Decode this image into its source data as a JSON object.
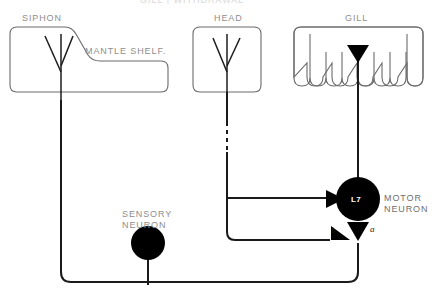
{
  "figure": {
    "top_cut_title": "GILL  |  WITHDRAWAL",
    "labels": {
      "siphon": "SIPHON",
      "mantle_shelf": "MANTLE SHELF.",
      "head": "HEAD",
      "gill": "GILL",
      "sensory_neuron": "SENSORY\nNEURON",
      "sensory_neuron_line1": "SENSORY",
      "sensory_neuron_line2": "NEURON",
      "motor_neuron_line1": "MOTOR",
      "motor_neuron_line2": "NEURON",
      "l7": "L7",
      "synapse_b": "b",
      "synapse_a": "a"
    },
    "colors": {
      "outline": "#3a3a3a",
      "organ_outline": "#6b6b6b",
      "neuron_fill": "#000000",
      "label_text": "#8e8e8e",
      "neuron_label_text": "#ffffff",
      "background": "#ffffff"
    },
    "structures": [
      {
        "name": "siphon",
        "type": "organ-outline",
        "label": "SIPHON"
      },
      {
        "name": "mantle-shelf",
        "type": "organ-outline",
        "label": "MANTLE SHELF."
      },
      {
        "name": "head",
        "type": "organ-outline",
        "label": "HEAD"
      },
      {
        "name": "gill",
        "type": "organ-outline",
        "label": "GILL",
        "lobes": 5
      },
      {
        "name": "sensory-neuron",
        "type": "cell-body",
        "label": "SENSORY NEURON"
      },
      {
        "name": "motor-neuron-l7",
        "type": "cell-body",
        "label": "L7 MOTOR NEURON"
      }
    ],
    "synapses": [
      {
        "name": "synapse-a",
        "label": "a",
        "shape": "triangle-down"
      },
      {
        "name": "synapse-b",
        "label": "b",
        "shape": "triangle-right"
      },
      {
        "name": "gill-terminal",
        "label": "",
        "shape": "triangle-down"
      },
      {
        "name": "head-terminal",
        "label": "",
        "shape": "triangle-right"
      }
    ]
  }
}
